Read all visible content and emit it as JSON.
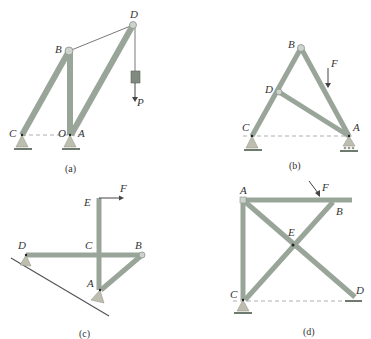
{
  "figure": {
    "panels": [
      {
        "id": "a",
        "caption": "(a)",
        "labels": {
          "B": "B",
          "D": "D",
          "C": "C",
          "O": "O",
          "A": "A",
          "P": "P⃗"
        }
      },
      {
        "id": "b",
        "caption": "(b)",
        "labels": {
          "B": "B",
          "D": "D",
          "C": "C",
          "A": "A",
          "F": "F⃗"
        }
      },
      {
        "id": "c",
        "caption": "(c)",
        "labels": {
          "E": "E",
          "F": "F⃗",
          "D": "D",
          "C": "C",
          "B": "B",
          "A": "A"
        }
      },
      {
        "id": "d",
        "caption": "(d)",
        "labels": {
          "A": "A",
          "F": "F⃗",
          "B": "B",
          "E": "E",
          "C": "C",
          "D": "D"
        }
      }
    ],
    "colors": {
      "member": "#9aa59a",
      "support": "#bdbdb0",
      "ground": "#6e7a6e",
      "text": "#333333"
    }
  }
}
